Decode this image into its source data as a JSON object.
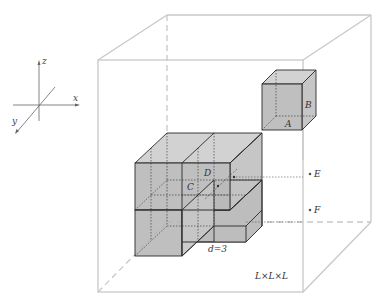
{
  "diagram": {
    "type": "3d-box-lattice",
    "axes": {
      "x_label": "x",
      "y_label": "y",
      "z_label": "z"
    },
    "container": {
      "label": "L×L×L"
    },
    "small_cube": {
      "labels": [
        "A",
        "B"
      ]
    },
    "cube_cluster": {
      "labels": [
        "C",
        "D"
      ],
      "dimension_label": "d=3"
    },
    "points": {
      "labels": [
        "E",
        "F"
      ]
    },
    "colors": {
      "container_line": "#c8c8c8",
      "cube_edge": "#2a2a2a",
      "cube_fill_front": "#b4b4b4",
      "cube_fill_top": "#d2d2d2",
      "cube_fill_side": "#c6c6c6"
    }
  }
}
